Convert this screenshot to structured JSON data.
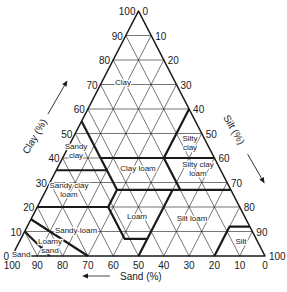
{
  "diagram": {
    "colors": {
      "line": "#1a1a1a",
      "background": "#ffffff"
    },
    "axes": {
      "clay": {
        "label": "Clay (%)",
        "ticks": [
          "0",
          "10",
          "20",
          "30",
          "40",
          "50",
          "60",
          "70",
          "80",
          "90",
          "100"
        ]
      },
      "silt": {
        "label": "Silt (%)",
        "ticks": [
          "0",
          "10",
          "20",
          "30",
          "40",
          "50",
          "60",
          "70",
          "80",
          "90",
          "100"
        ]
      },
      "sand": {
        "label": "Sand (%)",
        "ticks": [
          "100",
          "90",
          "80",
          "70",
          "60",
          "50",
          "40",
          "30",
          "20",
          "10",
          "0"
        ]
      }
    },
    "regions": [
      {
        "name": "Clay",
        "lines": [
          "Clay"
        ],
        "pos": [
          123,
          82
        ]
      },
      {
        "name": "Sandy clay",
        "lines": [
          "Sandy",
          "clay"
        ],
        "pos": [
          76,
          150
        ]
      },
      {
        "name": "Silty clay",
        "lines": [
          "Silty",
          "clay"
        ],
        "pos": [
          190,
          142
        ]
      },
      {
        "name": "Clay loam",
        "lines": [
          "Clay loam"
        ],
        "pos": [
          138,
          168
        ]
      },
      {
        "name": "Silty clay loam",
        "lines": [
          "Silty clay",
          "loam"
        ],
        "pos": [
          198,
          168
        ]
      },
      {
        "name": "Sandy clay loam",
        "lines": [
          "Sandy clay",
          "loam"
        ],
        "pos": [
          69,
          189
        ]
      },
      {
        "name": "Loam",
        "lines": [
          "Loam"
        ],
        "pos": [
          137,
          216
        ]
      },
      {
        "name": "Silt loam",
        "lines": [
          "Silt loam"
        ],
        "pos": [
          192,
          218
        ]
      },
      {
        "name": "Sandy loam",
        "lines": [
          "Sandy loam"
        ],
        "pos": [
          76,
          230
        ]
      },
      {
        "name": "Loamy sand",
        "lines": [
          "Loamy",
          "sand"
        ],
        "pos": [
          50,
          245
        ]
      },
      {
        "name": "Sand",
        "lines": [
          "Sand"
        ],
        "pos": [
          21,
          254
        ]
      },
      {
        "name": "Silt",
        "lines": [
          "Silt"
        ],
        "pos": [
          241,
          241
        ]
      }
    ]
  }
}
